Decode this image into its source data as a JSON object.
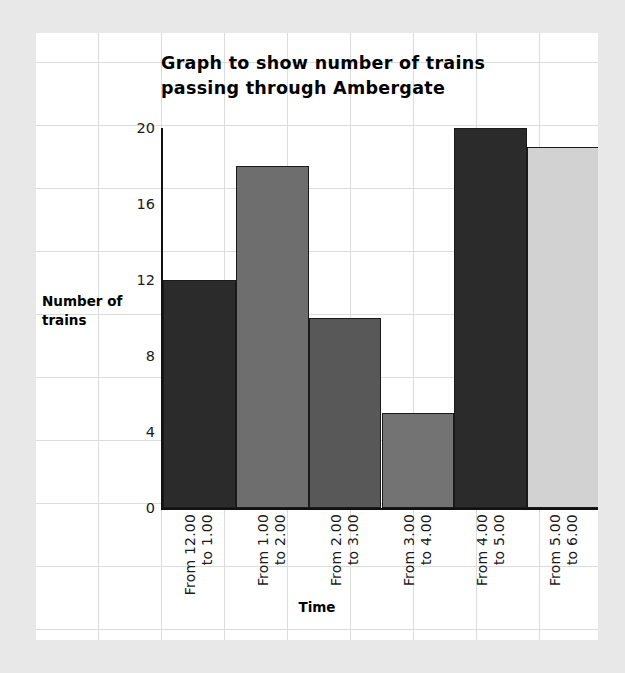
{
  "chart_data": {
    "type": "bar",
    "title": "Graph to show number of trains passing through Ambergate",
    "title_lines": [
      "Graph to show number of trains",
      "passing through Ambergate"
    ],
    "xlabel": "Time",
    "ylabel": "Number of trains",
    "ylabel_lines": [
      "Number of",
      "trains"
    ],
    "categories": [
      "From 12.00 to 1.00",
      "From 1.00 to 2.00",
      "From 2.00 to 3.00",
      "From 3.00 to 4.00",
      "From 4.00 to 5.00",
      "From 5.00 to 6.00"
    ],
    "category_lines": [
      [
        "From 12.00",
        "to 1.00"
      ],
      [
        "From 1.00",
        "to 2.00"
      ],
      [
        "From 2.00",
        "to 3.00"
      ],
      [
        "From 3.00",
        "to 4.00"
      ],
      [
        "From 4.00",
        "to 5.00"
      ],
      [
        "From 5.00",
        "to 6.00"
      ]
    ],
    "values": [
      12,
      18,
      10,
      5,
      20,
      19
    ],
    "bar_colors": [
      "#2b2b2b",
      "#6e6e6e",
      "#585858",
      "#737373",
      "#2b2b2b",
      "#d2d2d2"
    ],
    "ylim": [
      0,
      20
    ],
    "yticks": [
      0,
      4,
      8,
      12,
      16,
      20
    ],
    "ytick_labels": [
      "0",
      "4",
      "8",
      "12",
      "16",
      "20"
    ],
    "grid": true,
    "legend": "none"
  },
  "page": {
    "background_color": "#e8e8e8",
    "paper_color": "#ffffff",
    "grid_line_color": "#dcdcdc",
    "axis_color": "#111111"
  }
}
